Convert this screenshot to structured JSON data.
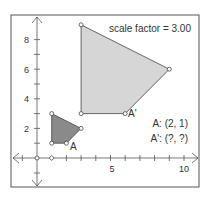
{
  "title": "scale factor = 3.00",
  "scale_factor": "3.00",
  "labels": {
    "A_info": "A: (2, 1)",
    "Aprime_info": "A': (?, ?)",
    "A": "A",
    "Aprime": "A'"
  },
  "axes": {
    "x_ticks": [
      "5",
      "10"
    ],
    "y_ticks": [
      "2",
      "4",
      "6",
      "8"
    ]
  },
  "colors": {
    "original_fill": "#8a8a8a",
    "image_fill": "#d6d6d6",
    "stroke": "#444444",
    "frame": "#555555"
  },
  "shapes": {
    "original": [
      [
        1,
        3
      ],
      [
        1,
        1
      ],
      [
        2,
        1
      ],
      [
        3,
        2
      ]
    ],
    "image": [
      [
        3,
        9
      ],
      [
        3,
        3
      ],
      [
        6,
        3
      ],
      [
        9,
        6
      ]
    ]
  }
}
